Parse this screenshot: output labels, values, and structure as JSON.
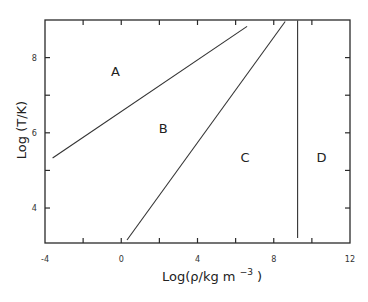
{
  "chart_data": {
    "type": "line",
    "title": "",
    "xlabel": "Log(ρ/kg m⁻³)",
    "ylabel": "Log (T/K)",
    "xlim": [
      -4,
      12
    ],
    "ylim": [
      3.07,
      9.0
    ],
    "grid": false,
    "x_ticks": [
      -4,
      0,
      4,
      8,
      12
    ],
    "x_tick_labels": [
      "-4",
      "0",
      "4",
      "8",
      "12"
    ],
    "x_minor_ticks": [
      -2,
      2,
      6,
      10
    ],
    "y_ticks": [
      4,
      6,
      8
    ],
    "y_tick_labels": [
      "4",
      "6",
      "8"
    ],
    "y_minor_ticks": [
      5,
      7
    ],
    "series": [
      {
        "name": "boundary A/B",
        "x": [
          -3.6,
          6.6
        ],
        "y": [
          5.33,
          8.83
        ]
      },
      {
        "name": "boundary B/C",
        "x": [
          0.3,
          8.6
        ],
        "y": [
          3.15,
          8.96
        ]
      },
      {
        "name": "boundary C/D",
        "x": [
          9.25,
          9.25
        ],
        "y": [
          3.2,
          8.99
        ]
      }
    ],
    "annotations": [
      {
        "text": "A",
        "x": -0.3,
        "y": 7.65
      },
      {
        "text": "B",
        "x": 2.2,
        "y": 6.13
      },
      {
        "text": "C",
        "x": 6.5,
        "y": 5.36
      },
      {
        "text": "D",
        "x": 10.5,
        "y": 5.36
      }
    ]
  },
  "labels": {
    "xlabel_main": "Log(ρ/kg m",
    "xlabel_sup": "−3",
    "xlabel_close": ")",
    "ylabel": "Log (T/K)"
  }
}
